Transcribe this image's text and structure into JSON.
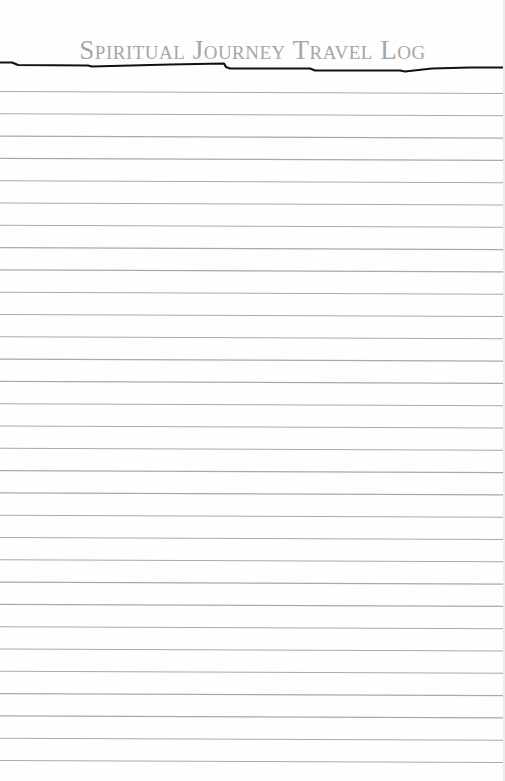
{
  "page": {
    "title": "Spiritual Journey Travel Log",
    "colors": {
      "background": "#fefefe",
      "title": "#a6a6a6",
      "header_rule": "#111111",
      "ruled_line": "#a9a9a9"
    },
    "ruled_lines": {
      "count": 31,
      "first_y_left": 91,
      "last_y_left": 760,
      "slope_px_across_page": 2
    }
  }
}
